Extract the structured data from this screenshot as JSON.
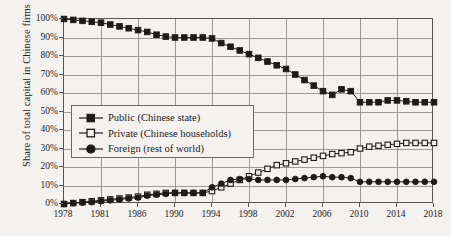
{
  "chart_data": {
    "type": "line",
    "title": "",
    "subtitle": "",
    "xlabel": "",
    "ylabel": "Share of total capital in Chinese firms",
    "ylim": [
      0,
      100
    ],
    "xlim": [
      1978,
      2018
    ],
    "grid": true,
    "legend_position": "inside-left-middle",
    "y_ticks": [
      "0%",
      "10%",
      "20%",
      "30%",
      "40%",
      "50%",
      "60%",
      "70%",
      "80%",
      "90%",
      "100%"
    ],
    "y_tick_values": [
      0,
      10,
      20,
      30,
      40,
      50,
      60,
      70,
      80,
      90,
      100
    ],
    "x_ticks": [
      "1978",
      "1981",
      "1986",
      "1990",
      "1994",
      "1998",
      "2002",
      "2006",
      "2010",
      "2014",
      "2018"
    ],
    "x_tick_values": [
      1978,
      1982,
      1986,
      1990,
      1994,
      1998,
      2002,
      2006,
      2010,
      2014,
      2018
    ],
    "x": [
      1978,
      1979,
      1980,
      1981,
      1982,
      1983,
      1984,
      1985,
      1986,
      1987,
      1988,
      1989,
      1990,
      1991,
      1992,
      1993,
      1994,
      1995,
      1996,
      1997,
      1998,
      1999,
      2000,
      2001,
      2002,
      2003,
      2004,
      2005,
      2006,
      2007,
      2008,
      2009,
      2010,
      2011,
      2012,
      2013,
      2014,
      2015,
      2016,
      2017,
      2018
    ],
    "series": [
      {
        "name": "Public (Chinese state)",
        "marker": "filled-square",
        "values": [
          100,
          99.5,
          99,
          98.5,
          98,
          97,
          96,
          95,
          94,
          93,
          91.5,
          90.5,
          90,
          90,
          90,
          90,
          89.5,
          87,
          85,
          83,
          81,
          79,
          77,
          75,
          73,
          70,
          67,
          64,
          61,
          59,
          62,
          61,
          55,
          55,
          55,
          56,
          56,
          55.5,
          55,
          55,
          55
        ]
      },
      {
        "name": "Private (Chinese households)",
        "marker": "open-square",
        "values": [
          0,
          0.5,
          1,
          1.5,
          2,
          2.5,
          3,
          3.5,
          4,
          5,
          5.5,
          6,
          6,
          6,
          6,
          6,
          7,
          9,
          11,
          13,
          15,
          17,
          19,
          21,
          22,
          23,
          24,
          25,
          26,
          27,
          27.5,
          28,
          30,
          31,
          31.5,
          32,
          32.5,
          33,
          33,
          33,
          33
        ]
      },
      {
        "name": "Foreign (rest of world)",
        "marker": "filled-circle",
        "values": [
          0,
          0.5,
          0.8,
          1,
          1.5,
          2,
          2.5,
          3,
          3.5,
          4.5,
          5,
          5.5,
          6,
          6,
          6,
          6,
          9,
          11,
          13,
          13.5,
          13.5,
          13,
          13,
          13,
          13,
          13.5,
          14,
          14.5,
          15,
          14.5,
          14.5,
          14,
          12,
          12,
          12,
          12,
          12,
          12,
          12,
          12,
          12
        ]
      }
    ]
  },
  "legend": {
    "items": [
      {
        "label": "Public (Chinese state)",
        "marker": "filled-square"
      },
      {
        "label": "Private (Chinese households)",
        "marker": "open-square"
      },
      {
        "label": "Foreign (rest of world)",
        "marker": "filled-circle"
      }
    ]
  },
  "colors": {
    "ink": "#1d1b19",
    "grid": "#8e8b87",
    "axis": "#585552",
    "background": "#f4f2ee"
  }
}
